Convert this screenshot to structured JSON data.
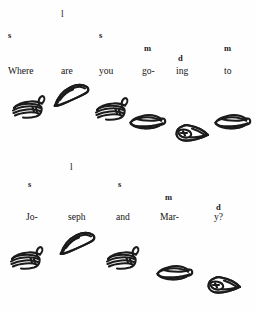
{
  "document": {
    "title": "Sign Language Gloss Notation",
    "background_color": "#fefefe",
    "ink_color": "#1b1b1b",
    "page_width": 255,
    "page_height": 312
  },
  "lines": [
    {
      "id": "line-1",
      "sentence": "Where are you going to",
      "markers": [
        {
          "label": "s",
          "x": 8,
          "y": 31
        },
        {
          "label": "l",
          "x": 61,
          "y": 10
        },
        {
          "label": "s",
          "x": 99,
          "y": 31
        },
        {
          "label": "m",
          "x": 144,
          "y": 44
        },
        {
          "label": "d",
          "x": 178,
          "y": 54
        },
        {
          "label": "m",
          "x": 224,
          "y": 44
        }
      ],
      "glosses": [
        {
          "label": "Where",
          "x": 8,
          "y": 66
        },
        {
          "label": "are",
          "x": 61,
          "y": 66
        },
        {
          "label": "you",
          "x": 99,
          "y": 66
        },
        {
          "label": "go-",
          "x": 142,
          "y": 66
        },
        {
          "label": "ing",
          "x": 176,
          "y": 66
        },
        {
          "label": "to",
          "x": 224,
          "y": 66
        }
      ],
      "hands": [
        {
          "shape": "flat-hand-right",
          "x": 10,
          "y": 95,
          "w": 40,
          "h": 26
        },
        {
          "shape": "tapered-hand",
          "x": 52,
          "y": 82,
          "w": 42,
          "h": 26
        },
        {
          "shape": "flat-hand-right",
          "x": 93,
          "y": 97,
          "w": 40,
          "h": 26
        },
        {
          "shape": "flat-hand-left",
          "x": 128,
          "y": 111,
          "w": 38,
          "h": 22
        },
        {
          "shape": "claw-hand-left",
          "x": 173,
          "y": 121,
          "w": 40,
          "h": 24
        },
        {
          "shape": "flat-hand-left",
          "x": 213,
          "y": 111,
          "w": 38,
          "h": 22
        }
      ]
    },
    {
      "id": "line-2",
      "sentence": "Joseph and Mary?",
      "markers": [
        {
          "label": "s",
          "x": 28,
          "y": 180
        },
        {
          "label": "l",
          "x": 70,
          "y": 163
        },
        {
          "label": "s",
          "x": 118,
          "y": 180
        },
        {
          "label": "m",
          "x": 165,
          "y": 193
        },
        {
          "label": "d",
          "x": 216,
          "y": 203
        }
      ],
      "glosses": [
        {
          "label": "Jo-",
          "x": 26,
          "y": 212
        },
        {
          "label": "seph",
          "x": 68,
          "y": 212
        },
        {
          "label": "and",
          "x": 116,
          "y": 212
        },
        {
          "label": "Mar-",
          "x": 160,
          "y": 212
        },
        {
          "label": "y?",
          "x": 214,
          "y": 212
        }
      ],
      "hands": [
        {
          "shape": "flat-hand-right",
          "x": 8,
          "y": 246,
          "w": 40,
          "h": 26
        },
        {
          "shape": "tapered-hand",
          "x": 58,
          "y": 230,
          "w": 42,
          "h": 26
        },
        {
          "shape": "flat-hand-right",
          "x": 104,
          "y": 246,
          "w": 40,
          "h": 26
        },
        {
          "shape": "flat-hand-left",
          "x": 155,
          "y": 262,
          "w": 38,
          "h": 22
        },
        {
          "shape": "claw-hand-left",
          "x": 205,
          "y": 273,
          "w": 40,
          "h": 24
        }
      ]
    }
  ],
  "icon_names": {
    "flat-hand-right": "flat-hand-right-icon",
    "flat-hand-left": "flat-hand-left-icon",
    "tapered-hand": "tapered-hand-icon",
    "claw-hand-left": "claw-hand-left-icon"
  }
}
